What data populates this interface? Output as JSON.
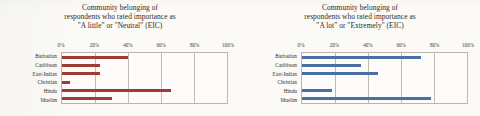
{
  "figure": {
    "background_color": "#fbfaf7",
    "panels": [
      {
        "id": "left",
        "title_line1": "Community belonging of",
        "title_line2": "respondents who rated importance as",
        "title_line3": "\"A little\" or \"Neutral\" (EIC)",
        "bar_color": "#9E3B32",
        "chart_data": {
          "type": "bar",
          "orientation": "horizontal",
          "title": "Community belonging of respondents who rated importance as \"A little\" or \"Neutral\" (EIC)",
          "categories": [
            "Barbadian",
            "Caribbean",
            "East-Indian",
            "Christian",
            "Hindu",
            "Muslim"
          ],
          "values": [
            40,
            23,
            23,
            5,
            66,
            30
          ],
          "xlabel": "",
          "ylabel": "",
          "xlim": [
            0,
            100
          ],
          "xticks": [
            0,
            20,
            40,
            60,
            80,
            100
          ],
          "xticklabels": [
            "0%",
            "20%",
            "40%",
            "60%",
            "80%",
            "100%"
          ],
          "grid": "vertical",
          "legend": "none"
        }
      },
      {
        "id": "right",
        "title_line1": "Community belonging of",
        "title_line2": "respondents who rated importance as",
        "title_line3": "\"A lot\" or \"Extremely\" (EIC)",
        "bar_color": "#4A6FA5",
        "chart_data": {
          "type": "bar",
          "orientation": "horizontal",
          "title": "Community belonging of respondents who rated importance as \"A lot\" or \"Extremely\" (EIC)",
          "categories": [
            "Barbadian",
            "Caribbean",
            "East-Indian",
            "Christian",
            "Hindu",
            "Muslim"
          ],
          "values": [
            72,
            36,
            46,
            0,
            18,
            78
          ],
          "xlabel": "",
          "ylabel": "",
          "xlim": [
            0,
            100
          ],
          "xticks": [
            0,
            20,
            40,
            60,
            80,
            100
          ],
          "xticklabels": [
            "0%",
            "20%",
            "40%",
            "60%",
            "80%",
            "100%"
          ],
          "grid": "vertical",
          "legend": "none"
        }
      }
    ]
  }
}
